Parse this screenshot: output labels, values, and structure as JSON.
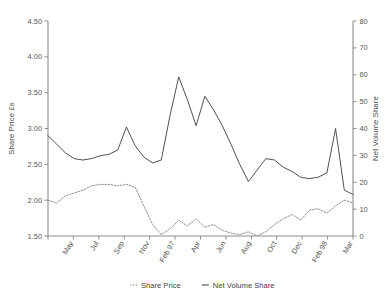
{
  "chart_data": {
    "type": "line",
    "title": "",
    "xlabel": "",
    "ylabel": "Share Price £s",
    "y2label": "Net Volume Share",
    "ylim": [
      1.5,
      4.5
    ],
    "y2lim": [
      0,
      80
    ],
    "grid": false,
    "legend_position": "bottom",
    "ytick_labels": [
      "4.50",
      "4.00",
      "3.50",
      "3.00",
      "2.50",
      "2.00",
      "1.50"
    ],
    "ytick_values": [
      4.5,
      4.0,
      3.5,
      3.0,
      2.5,
      2.0,
      1.5
    ],
    "y2tick_labels": [
      "80",
      "70",
      "60",
      "50",
      "40",
      "30",
      "20",
      "10",
      "0"
    ],
    "y2tick_values": [
      80,
      70,
      60,
      50,
      40,
      30,
      20,
      10,
      0
    ],
    "xtick_labels": [
      "May",
      "Jul",
      "Sep",
      "Nov",
      "Feb 97",
      "Apr",
      "Jun",
      "Aug",
      "Oct",
      "Dec",
      "Feb 98",
      "Mar"
    ],
    "x": [
      0,
      1,
      2,
      3,
      4,
      5,
      6,
      7,
      8,
      9,
      10,
      11,
      12,
      13,
      14,
      15,
      16,
      17,
      18,
      19,
      20,
      21,
      22,
      23,
      24,
      25,
      26,
      27,
      28,
      29,
      30,
      31,
      32,
      33,
      34,
      35
    ],
    "series": [
      {
        "name": "Net Volume Share",
        "style": "solid",
        "axis": "left",
        "color": "#3c3c3c",
        "values": [
          2.9,
          2.78,
          2.66,
          2.58,
          2.56,
          2.58,
          2.62,
          2.64,
          2.7,
          3.02,
          2.76,
          2.6,
          2.52,
          2.56,
          3.18,
          3.72,
          3.4,
          3.04,
          3.45,
          3.26,
          3.04,
          2.78,
          2.5,
          2.26,
          2.42,
          2.58,
          2.56,
          2.46,
          2.4,
          2.32,
          2.3,
          2.32,
          2.38,
          3.0,
          2.14,
          2.08
        ]
      },
      {
        "name": "Share Price",
        "style": "dotted",
        "axis": "right",
        "color": "#8a8a8a",
        "values": [
          2.0,
          1.96,
          2.06,
          2.1,
          2.14,
          2.2,
          2.22,
          2.22,
          2.2,
          2.22,
          2.18,
          1.92,
          1.66,
          1.52,
          1.6,
          1.72,
          1.64,
          1.74,
          1.62,
          1.66,
          1.58,
          1.54,
          1.52,
          1.56,
          1.5,
          1.56,
          1.66,
          1.74,
          1.8,
          1.72,
          1.86,
          1.88,
          1.82,
          1.92,
          2.0,
          1.96
        ]
      }
    ],
    "legend": [
      {
        "label": "Share Price",
        "style": "dotted"
      },
      {
        "label": "Net Volume Share",
        "style": "solid"
      }
    ]
  }
}
